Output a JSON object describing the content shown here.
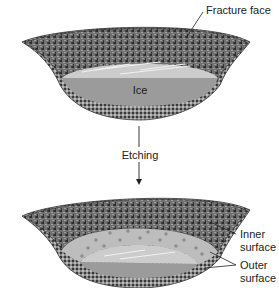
{
  "labels": {
    "fracture_face": "Fracture face",
    "ice": "Ice",
    "etching": "Etching",
    "inner_surface_line1": "Inner",
    "inner_surface_line2": "surface",
    "outer_surface_line1": "Outer",
    "outer_surface_line2": "surface"
  },
  "colors": {
    "fracture": "#6e6e6e",
    "fracture_dark": "#3c3c3c",
    "ice_top": "#c9c9c9",
    "ice_body": "#9a9a9a",
    "etched_zone": "#bdbdbd",
    "membrane": "#555555"
  }
}
